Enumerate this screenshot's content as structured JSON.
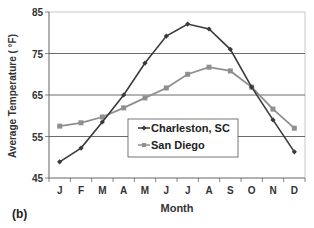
{
  "panel_label": "(b)",
  "chart_data": {
    "type": "line",
    "title": "",
    "xlabel": "Month",
    "ylabel": "Average Temperature ( °F)",
    "ylim": [
      45,
      85
    ],
    "yticks": [
      45,
      55,
      65,
      75,
      85
    ],
    "grid": true,
    "legend_position": "inside-center-bottom",
    "categories": [
      "J",
      "F",
      "M",
      "A",
      "M",
      "J",
      "J",
      "A",
      "S",
      "O",
      "N",
      "D"
    ],
    "series": [
      {
        "name": "Charleston, SC",
        "color": "#3a3a3a",
        "marker": "diamond",
        "values": [
          48.9,
          52.2,
          58.5,
          65.0,
          72.7,
          79.2,
          82.1,
          80.9,
          76.0,
          66.9,
          59.0,
          51.3
        ]
      },
      {
        "name": "San Diego",
        "color": "#8f8f8f",
        "marker": "square",
        "values": [
          57.5,
          58.3,
          59.7,
          61.9,
          64.3,
          66.7,
          70.0,
          71.7,
          70.8,
          66.9,
          61.6,
          57.0
        ]
      }
    ]
  }
}
